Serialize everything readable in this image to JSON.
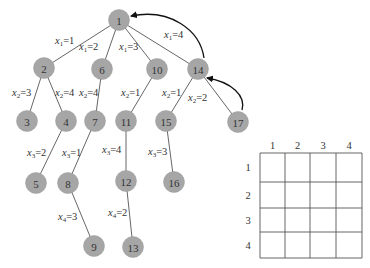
{
  "tree": {
    "nodes": [
      {
        "id": "1",
        "x": 119,
        "y": 20
      },
      {
        "id": "2",
        "x": 44,
        "y": 68
      },
      {
        "id": "6",
        "x": 102,
        "y": 69
      },
      {
        "id": "10",
        "x": 157,
        "y": 69
      },
      {
        "id": "14",
        "x": 198,
        "y": 69
      },
      {
        "id": "3",
        "x": 27,
        "y": 121
      },
      {
        "id": "4",
        "x": 66,
        "y": 121
      },
      {
        "id": "7",
        "x": 95,
        "y": 121
      },
      {
        "id": "11",
        "x": 126,
        "y": 121
      },
      {
        "id": "15",
        "x": 166,
        "y": 121
      },
      {
        "id": "17",
        "x": 238,
        "y": 122
      },
      {
        "id": "5",
        "x": 36,
        "y": 183
      },
      {
        "id": "8",
        "x": 68,
        "y": 183
      },
      {
        "id": "12",
        "x": 126,
        "y": 181
      },
      {
        "id": "16",
        "x": 174,
        "y": 182
      },
      {
        "id": "9",
        "x": 94,
        "y": 246
      },
      {
        "id": "13",
        "x": 133,
        "y": 247
      }
    ],
    "edges": [
      {
        "from": "1",
        "to": "2",
        "var": "x",
        "sub": "1",
        "val": "1",
        "lx": 55,
        "ly": 44
      },
      {
        "from": "1",
        "to": "6",
        "var": "x",
        "sub": "1",
        "val": "2",
        "lx": 79,
        "ly": 50
      },
      {
        "from": "1",
        "to": "10",
        "var": "x",
        "sub": "1",
        "val": "3",
        "lx": 119,
        "ly": 50
      },
      {
        "from": "1",
        "to": "14",
        "var": "x",
        "sub": "1",
        "val": "4",
        "lx": 164,
        "ly": 38
      },
      {
        "from": "2",
        "to": "3",
        "var": "x",
        "sub": "2",
        "val": "3",
        "lx": 12,
        "ly": 96
      },
      {
        "from": "2",
        "to": "4",
        "var": "x",
        "sub": "2",
        "val": "4",
        "lx": 55,
        "ly": 96
      },
      {
        "from": "6",
        "to": "7",
        "var": "x",
        "sub": "2",
        "val": "4",
        "lx": 79,
        "ly": 96
      },
      {
        "from": "10",
        "to": "11",
        "var": "x",
        "sub": "2",
        "val": "1",
        "lx": 121,
        "ly": 96
      },
      {
        "from": "14",
        "to": "15",
        "var": "x",
        "sub": "2",
        "val": "1",
        "lx": 162,
        "ly": 96
      },
      {
        "from": "14",
        "to": "17",
        "var": "x",
        "sub": "2",
        "val": "2",
        "lx": 188,
        "ly": 101
      },
      {
        "from": "4",
        "to": "5",
        "var": "x",
        "sub": "3",
        "val": "2",
        "lx": 27,
        "ly": 156
      },
      {
        "from": "7",
        "to": "8",
        "var": "x",
        "sub": "3",
        "val": "1",
        "lx": 62,
        "ly": 156
      },
      {
        "from": "11",
        "to": "12",
        "var": "x",
        "sub": "3",
        "val": "4",
        "lx": 102,
        "ly": 153
      },
      {
        "from": "15",
        "to": "16",
        "var": "x",
        "sub": "3",
        "val": "3",
        "lx": 148,
        "ly": 155
      },
      {
        "from": "8",
        "to": "9",
        "var": "x",
        "sub": "4",
        "val": "3",
        "lx": 58,
        "ly": 220
      },
      {
        "from": "12",
        "to": "13",
        "var": "x",
        "sub": "4",
        "val": "2",
        "lx": 108,
        "ly": 216
      }
    ],
    "back_arrows": [
      {
        "from": "14",
        "to": "1",
        "path": "M 204 58 C 200 30, 170 8, 131 16"
      },
      {
        "from": "17",
        "to": "14",
        "path": "M 242 110 C 246 96, 232 82, 207 78"
      }
    ]
  },
  "matrix": {
    "col_labels": [
      "1",
      "2",
      "3",
      "4"
    ],
    "row_labels": [
      "1",
      "2",
      "3",
      "4"
    ],
    "col_x": [
      260,
      285,
      310,
      336,
      362
    ],
    "row_y": [
      153,
      182,
      208,
      232,
      258
    ],
    "col_label_y": 145,
    "row_label_x": 248
  }
}
